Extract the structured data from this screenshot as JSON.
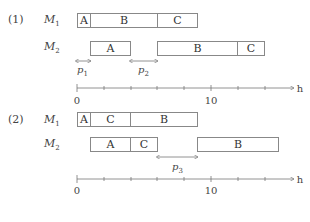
{
  "diagram": {
    "type": "gantt-schedule-comparison",
    "unit_label": "h",
    "axis_ticks": [
      {
        "value": 0,
        "label": "0"
      },
      {
        "value": 10,
        "label": "10"
      }
    ],
    "axis_tick_step": 2,
    "axis_max": 16,
    "parts": [
      {
        "label": "(1)",
        "machines": [
          {
            "name": "M",
            "sub": "1",
            "jobs": [
              {
                "label": "A",
                "start": 0,
                "end": 1
              },
              {
                "label": "B",
                "start": 1,
                "end": 6
              },
              {
                "label": "C",
                "start": 6,
                "end": 9
              }
            ]
          },
          {
            "name": "M",
            "sub": "2",
            "jobs": [
              {
                "label": "A",
                "start": 1,
                "end": 4
              },
              {
                "label": "B",
                "start": 6,
                "end": 12
              },
              {
                "label": "C",
                "start": 12,
                "end": 14
              }
            ]
          }
        ],
        "gaps": [
          {
            "name": "p",
            "sub": "1",
            "start": 0,
            "end": 1
          },
          {
            "name": "p",
            "sub": "2",
            "start": 4,
            "end": 6
          }
        ]
      },
      {
        "label": "(2)",
        "machines": [
          {
            "name": "M",
            "sub": "1",
            "jobs": [
              {
                "label": "A",
                "start": 0,
                "end": 1
              },
              {
                "label": "C",
                "start": 1,
                "end": 4
              },
              {
                "label": "B",
                "start": 4,
                "end": 9
              }
            ]
          },
          {
            "name": "M",
            "sub": "2",
            "jobs": [
              {
                "label": "A",
                "start": 1,
                "end": 4
              },
              {
                "label": "C",
                "start": 4,
                "end": 6
              },
              {
                "label": "B",
                "start": 9,
                "end": 15
              }
            ]
          }
        ],
        "gaps": [
          {
            "name": "p",
            "sub": "3",
            "start": 6,
            "end": 9
          }
        ]
      }
    ]
  }
}
